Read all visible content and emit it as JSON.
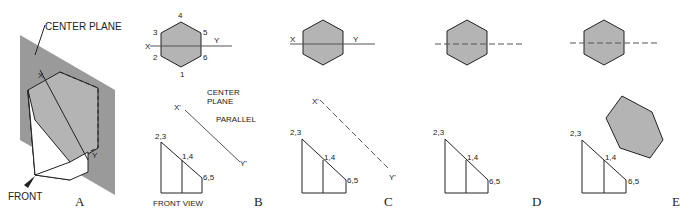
{
  "figure": {
    "panels": [
      {
        "id": "A",
        "caption": "A",
        "labels": {
          "center_plane": "CENTER PLANE",
          "front": "FRONT",
          "x": "X",
          "y": "Y"
        }
      },
      {
        "id": "B",
        "caption": "B",
        "labels": {
          "x": "X",
          "y": "Y",
          "x_prime": "X'",
          "y_prime": "Y'",
          "center_plane_1": "CENTER",
          "center_plane_2": "PLANE",
          "parallel": "PARALLEL",
          "front_view": "FRONT VIEW",
          "v23": "2,3",
          "v14": "1,4",
          "v65": "6,5",
          "n1": "1",
          "n2": "2",
          "n3": "3",
          "n4": "4",
          "n5": "5",
          "n6": "6"
        }
      },
      {
        "id": "C",
        "caption": "C",
        "labels": {
          "x": "X",
          "y": "Y",
          "x_prime": "X'",
          "y_prime": "Y'",
          "v23": "2,3",
          "v14": "1,4",
          "v65": "6,5",
          "n1": "1",
          "n2": "2",
          "n3": "3",
          "n4": "4",
          "n5": "5",
          "n6": "6"
        }
      },
      {
        "id": "D",
        "caption": "D",
        "labels": {
          "x": "X",
          "y": "Y",
          "x_prime": "X'",
          "y_prime": "Y'",
          "d1": "D1",
          "d2": "D2",
          "v23": "2,3",
          "v14": "1,4",
          "v65": "6,5",
          "n1": "1",
          "n2": "2",
          "n3": "3",
          "n4": "4",
          "n5": "5",
          "n6": "6"
        }
      },
      {
        "id": "E",
        "caption": "E",
        "labels": {
          "d1": "D1",
          "d2": "D2",
          "v23": "2,3",
          "v14": "1,4",
          "v65": "6,5",
          "n1": "1",
          "n2": "2",
          "n3": "3",
          "n4": "4",
          "n5": "5",
          "n6": "6"
        }
      }
    ],
    "colors": {
      "fill": "#b4b4b4",
      "plane": "#9a9a9a",
      "line": "#222222"
    }
  }
}
